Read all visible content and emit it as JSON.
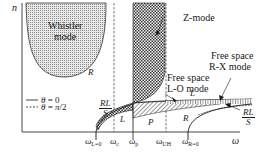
{
  "diagram": {
    "y_axis_label": "n",
    "x_axis_label": "ω",
    "colors": {
      "ink": "#1a1a1a",
      "whistler_fill": "#b8b8b8",
      "zmode_fill": "#555555"
    },
    "regions": {
      "whistler": {
        "line1": "Whistler",
        "line2": "mode",
        "branch": "R"
      },
      "zmode": {
        "label": "Z-mode"
      }
    },
    "annotations": {
      "free_space_rx": {
        "line1": "Free space",
        "line2": "R-X mode"
      },
      "free_space_lo": {
        "line1": "Free space",
        "line2": "L-O mode"
      }
    },
    "branch_labels": {
      "rl_s_left": {
        "num": "RL",
        "den": "S"
      },
      "rl_s_right": {
        "num": "RL",
        "den": "S"
      },
      "L_low": "L",
      "P": "P",
      "L_high": "L",
      "R_high": "R"
    },
    "legend": [
      {
        "style": "solid",
        "text": "θ = 0"
      },
      {
        "style": "dashed",
        "text": "θ = π/2"
      }
    ],
    "x_ticks": [
      {
        "sym": "ω",
        "sub": "L=0"
      },
      {
        "sym": "ω",
        "sub": "c"
      },
      {
        "sym": "ω",
        "sub": "p"
      },
      {
        "sym": "ω",
        "sub": "UH"
      },
      {
        "sym": "ω",
        "sub": "R=0"
      }
    ]
  }
}
